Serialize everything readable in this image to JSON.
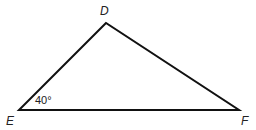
{
  "diagram": {
    "type": "triangle",
    "vertices": [
      {
        "label": "D",
        "x": 106,
        "y": 23
      },
      {
        "label": "E",
        "x": 19,
        "y": 110
      },
      {
        "label": "F",
        "x": 239,
        "y": 110
      }
    ],
    "angle_label": "40°",
    "angle_vertex": "E",
    "stroke_color": "#111111"
  }
}
